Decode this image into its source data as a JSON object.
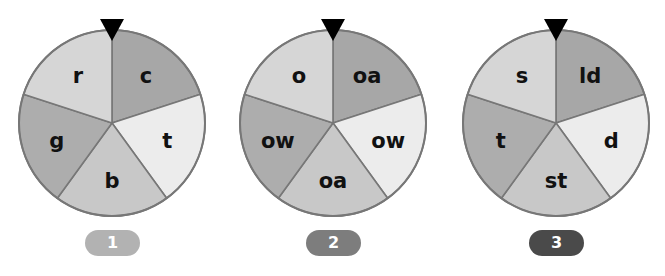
{
  "wheels": [
    {
      "number": "1",
      "badge_color": "#b2b2b2",
      "center_x": 112,
      "segments": [
        {
          "label": "c",
          "color": "#a7a7a7"
        },
        {
          "label": "t",
          "color": "#ececec"
        },
        {
          "label": "b",
          "color": "#c8c8c8"
        },
        {
          "label": "g",
          "color": "#adadad"
        },
        {
          "label": "r",
          "color": "#d6d6d6"
        }
      ]
    },
    {
      "number": "2",
      "badge_color": "#7d7d7d",
      "center_x": 333,
      "segments": [
        {
          "label": "oa",
          "color": "#a7a7a7"
        },
        {
          "label": "ow",
          "color": "#ececec"
        },
        {
          "label": "oa",
          "color": "#c8c8c8"
        },
        {
          "label": "ow",
          "color": "#adadad"
        },
        {
          "label": "o",
          "color": "#d6d6d6"
        }
      ]
    },
    {
      "number": "3",
      "badge_color": "#4a4a4a",
      "center_x": 556,
      "segments": [
        {
          "label": "ld",
          "color": "#a7a7a7"
        },
        {
          "label": "d",
          "color": "#ececec"
        },
        {
          "label": "st",
          "color": "#c8c8c8"
        },
        {
          "label": "t",
          "color": "#adadad"
        },
        {
          "label": "s",
          "color": "#d6d6d6"
        }
      ]
    }
  ],
  "style": {
    "divider_color": "#777777",
    "pointer_color": "#000000",
    "label_color": "#111111",
    "badge_text_color": "#ffffff"
  }
}
